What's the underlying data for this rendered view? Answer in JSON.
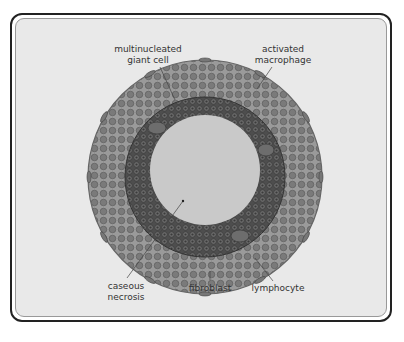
{
  "diagram": {
    "labels": [
      {
        "id": "multinucleated-giant-cell",
        "text": "multinucleated\ngiant cell",
        "x": 148,
        "y": 44
      },
      {
        "id": "activated-macrophage",
        "text": "activated\nmacrophage",
        "x": 283,
        "y": 44
      },
      {
        "id": "caseous-necrosis",
        "text": "caseous\nnecrosis",
        "x": 126,
        "y": 280
      },
      {
        "id": "fibroblast",
        "text": "fibroblast",
        "x": 210,
        "y": 283
      },
      {
        "id": "lymphocyte",
        "text": "lymphocyte",
        "x": 278,
        "y": 283
      }
    ],
    "colors": {
      "background": "#e9e9e9",
      "outer_ring": "#8a8a8a",
      "middle_ring": "#5e5e5e",
      "center": "#c9c9c9",
      "frame": "#222222"
    }
  }
}
